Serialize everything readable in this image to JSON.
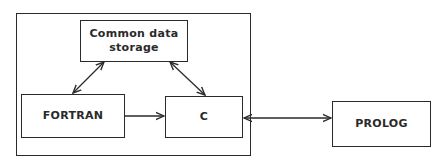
{
  "diagram": {
    "group": {
      "label": ""
    },
    "nodes": [
      {
        "id": "storage",
        "label": "Common data storage",
        "line1": "Common data",
        "line2": "storage"
      },
      {
        "id": "fortran",
        "label": "FORTRAN"
      },
      {
        "id": "c",
        "label": "C"
      },
      {
        "id": "prolog",
        "label": "PROLOG"
      }
    ],
    "edges": [
      {
        "from": "fortran",
        "to": "storage",
        "direction": "both"
      },
      {
        "from": "c",
        "to": "storage",
        "direction": "both"
      },
      {
        "from": "fortran",
        "to": "c",
        "direction": "forward"
      },
      {
        "from": "c",
        "to": "prolog",
        "direction": "both"
      }
    ],
    "colors": {
      "line": "#2a2a2a",
      "background": "#ffffff"
    }
  }
}
